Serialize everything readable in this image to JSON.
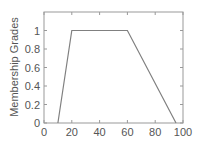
{
  "chart_data": {
    "type": "line",
    "title": "",
    "xlabel": "",
    "ylabel": "Membership Grades",
    "xlim": [
      0,
      100
    ],
    "ylim": [
      0,
      1.2
    ],
    "x_ticks": [
      0,
      20,
      40,
      60,
      80,
      100
    ],
    "x_tick_labels": [
      "0",
      "20",
      "40",
      "60",
      "80",
      "100"
    ],
    "y_ticks": [
      0,
      0.2,
      0.4,
      0.6,
      0.8,
      1
    ],
    "y_tick_labels": [
      "0",
      "0.2",
      "0.4",
      "0.6",
      "0.8",
      "1"
    ],
    "grid": false,
    "legend": null,
    "series": [
      {
        "name": "trapezoidal membership function",
        "x": [
          10,
          20,
          60,
          95
        ],
        "y": [
          0,
          1,
          1,
          0
        ],
        "color": "#808080"
      }
    ]
  },
  "colors": {
    "axes": "#999999",
    "line": "#808080",
    "text": "#555555"
  }
}
